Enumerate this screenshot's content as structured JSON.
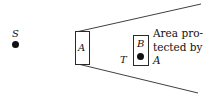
{
  "figure": {
    "type": "geometric-diagram",
    "background_color": "#ffffff",
    "line_color": "#2a2a2a",
    "text_color": "#111111",
    "width": 215,
    "height": 98
  },
  "nodes": {
    "source": {
      "label": "S",
      "marker": "filled-dot"
    },
    "blocker": {
      "label": "A",
      "shape": "rectangle"
    },
    "protected": {
      "label": "B",
      "shape": "rectangle",
      "marker": "filled-dot"
    },
    "target": {
      "label": "T"
    }
  },
  "caption": {
    "line1": "Area pro-",
    "line2": "tected by",
    "line3": "A"
  },
  "cone": {
    "upper_line": {
      "x1": 76,
      "y1": 32,
      "x2": 201,
      "y2": 4
    },
    "lower_line": {
      "x1": 78,
      "y1": 64,
      "x2": 198,
      "y2": 93
    }
  }
}
